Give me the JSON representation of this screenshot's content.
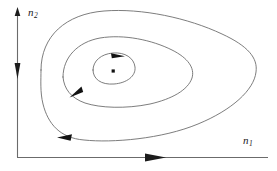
{
  "figure": {
    "type": "phase-portrait",
    "title": "",
    "background_color": "#ffffff",
    "width": 277,
    "height": 171
  },
  "axes": {
    "x_axis": {
      "label": "n",
      "subscript": "1",
      "color": "#555555",
      "origin": [
        17,
        157
      ],
      "end": [
        268,
        157
      ],
      "arrow_position": [
        155,
        157
      ],
      "arrow_direction": "right"
    },
    "y_axis": {
      "label": "n",
      "subscript": "2",
      "color": "#555555",
      "origin": [
        17,
        157
      ],
      "end": [
        17,
        8
      ],
      "arrow_tip": [
        17,
        8
      ],
      "arrow_direction": "up",
      "mid_arrow_position": [
        17,
        72
      ],
      "mid_arrow_direction": "down"
    }
  },
  "curves": [
    {
      "name": "outer-orbit",
      "stroke": "#666666",
      "stroke_width": 0.9,
      "closed": true,
      "direction": "counterclockwise",
      "arrows": [
        {
          "position": [
            66,
            138
          ],
          "direction": "left"
        }
      ]
    },
    {
      "name": "middle-orbit",
      "stroke": "#666666",
      "stroke_width": 0.9,
      "closed": true,
      "direction": "counterclockwise",
      "arrows": [
        {
          "position": [
            76,
            93
          ],
          "direction": "down-left"
        }
      ]
    },
    {
      "name": "inner-orbit",
      "stroke": "#666666",
      "stroke_width": 0.9,
      "closed": true,
      "direction": "counterclockwise",
      "arrows": [
        {
          "position": [
            118,
            55
          ],
          "direction": "right"
        }
      ]
    }
  ],
  "center_point": {
    "name": "equilibrium-point",
    "position": [
      113,
      71
    ],
    "color": "#111111",
    "size": 3
  }
}
